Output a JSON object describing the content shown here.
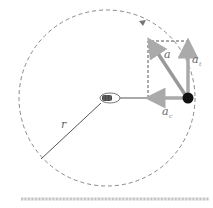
{
  "diagram": {
    "type": "circular-motion-acceleration",
    "labels": {
      "radius": "r",
      "total_acceleration": "a",
      "tangential_acceleration": "a",
      "tangential_subscript": "t",
      "centripetal_acceleration": "a",
      "centripetal_subscript": "c"
    },
    "colors": {
      "circle": "#888888",
      "vector": "#aaaaaa",
      "radius_line": "#555555",
      "ball": "#111111",
      "ground": "#aaaaaa"
    },
    "geometry": {
      "center": [
        107,
        98
      ],
      "circle_radius": 88,
      "ball": [
        188,
        98
      ]
    }
  }
}
